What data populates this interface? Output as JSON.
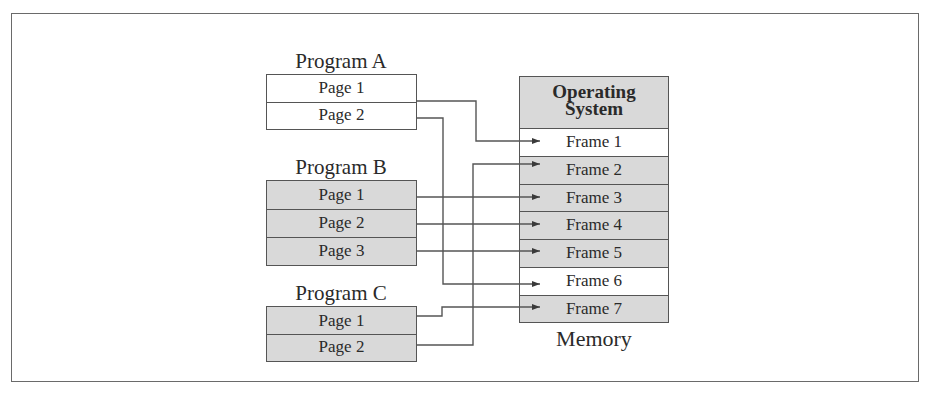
{
  "diagram": {
    "programs": [
      {
        "title": "Program A",
        "shaded": false,
        "pages": [
          "Page 1",
          "Page 2"
        ]
      },
      {
        "title": "Program B",
        "shaded": true,
        "pages": [
          "Page 1",
          "Page 2",
          "Page 3"
        ]
      },
      {
        "title": "Program C",
        "shaded": true,
        "pages": [
          "Page 1",
          "Page 2"
        ]
      }
    ],
    "memory": {
      "label": "Memory",
      "os_line1": "Operating",
      "os_line2": "System",
      "frames": [
        {
          "label": "Frame 1",
          "shaded": false
        },
        {
          "label": "Frame 2",
          "shaded": true
        },
        {
          "label": "Frame 3",
          "shaded": true
        },
        {
          "label": "Frame 4",
          "shaded": true
        },
        {
          "label": "Frame 5",
          "shaded": true
        },
        {
          "label": "Frame 6",
          "shaded": false
        },
        {
          "label": "Frame 7",
          "shaded": true
        }
      ]
    },
    "mappings": [
      {
        "from": "Program A / Page 1",
        "to": "Frame 1"
      },
      {
        "from": "Program A / Page 2",
        "to": "Frame 6"
      },
      {
        "from": "Program B / Page 1",
        "to": "Frame 3"
      },
      {
        "from": "Program B / Page 2",
        "to": "Frame 4"
      },
      {
        "from": "Program B / Page 3",
        "to": "Frame 5"
      },
      {
        "from": "Program C / Page 1",
        "to": "Frame 7"
      },
      {
        "from": "Program C / Page 2",
        "to": "Frame 2"
      }
    ],
    "colors": {
      "shaded": "#d9d9d9",
      "line": "#555555",
      "border": "#6a6a6a"
    }
  }
}
